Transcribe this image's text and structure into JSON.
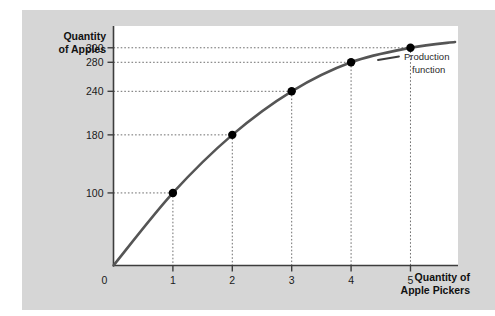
{
  "figure": {
    "panel_color": "#d6d6d6",
    "plot_background": "#ffffff",
    "curve_color": "#555555",
    "marker_color": "#000000",
    "leader_color": "#6e6e6e",
    "axis_color": "#3d3d3d"
  },
  "axes": {
    "y_title_line1": "Quantity",
    "y_title_line2": "of Apples",
    "x_title_line1": "Quantity of",
    "x_title_line2": "Apple Pickers",
    "origin_label": "0"
  },
  "annotation": {
    "line1": "Production",
    "line2": "function"
  },
  "chart_data": {
    "type": "line",
    "title": "",
    "subtitle": "",
    "xlabel": "Quantity of Apple Pickers",
    "ylabel": "Quantity of Apples",
    "xlim": [
      0,
      5.8
    ],
    "ylim": [
      0,
      330
    ],
    "grid": false,
    "legend_position": "inline-annotation",
    "x_tick_labels": [
      "0",
      "1",
      "2",
      "3",
      "4",
      "5"
    ],
    "x_tick_values": [
      0,
      1,
      2,
      3,
      4,
      5
    ],
    "y_tick_labels": [
      "100",
      "180",
      "240",
      "280",
      "300"
    ],
    "y_tick_values": [
      100,
      180,
      240,
      280,
      300
    ],
    "series": [
      {
        "name": "Production function",
        "x": [
          0,
          1,
          2,
          3,
          4,
          5
        ],
        "values": [
          0,
          100,
          180,
          240,
          280,
          300
        ],
        "marker": "filled-circle",
        "color": "#555555"
      }
    ],
    "annotations": [
      {
        "text": "Production function",
        "attached_to": "curve-end"
      }
    ],
    "leader_lines": [
      {
        "x": 1,
        "y": 100
      },
      {
        "x": 2,
        "y": 180
      },
      {
        "x": 3,
        "y": 240
      },
      {
        "x": 4,
        "y": 280
      },
      {
        "x": 5,
        "y": 300
      }
    ]
  }
}
